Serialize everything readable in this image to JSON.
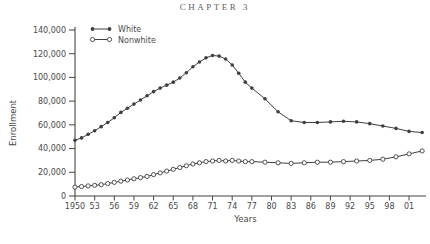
{
  "page": {
    "header": "CHAPTER 3"
  },
  "chart_data": {
    "type": "line",
    "title": "",
    "xlabel": "Years",
    "ylabel": "Enrollment",
    "ylim": [
      0,
      140000
    ],
    "xlim": [
      1950,
      2003
    ],
    "grid": false,
    "legend_position": "top-left",
    "y_ticks": {
      "values": [
        0,
        20000,
        40000,
        60000,
        80000,
        100000,
        120000,
        140000
      ],
      "labels": [
        "0",
        "20,000",
        "40,000",
        "60,000",
        "80,000",
        "100,000",
        "120,000",
        "140,000"
      ]
    },
    "x_ticks": {
      "years": [
        1950,
        1953,
        1956,
        1959,
        1962,
        1965,
        1968,
        1971,
        1974,
        1977,
        1980,
        1983,
        1986,
        1989,
        1992,
        1995,
        1998,
        2001
      ],
      "labels": [
        "1950",
        "53",
        "56",
        "59",
        "62",
        "65",
        "68",
        "71",
        "74",
        "77",
        "80",
        "83",
        "86",
        "89",
        "92",
        "95",
        "98",
        "01"
      ]
    },
    "x": [
      1950,
      1951,
      1952,
      1953,
      1954,
      1955,
      1956,
      1957,
      1958,
      1959,
      1960,
      1961,
      1962,
      1963,
      1964,
      1965,
      1966,
      1967,
      1968,
      1969,
      1970,
      1971,
      1972,
      1973,
      1974,
      1975,
      1976,
      1977,
      1979,
      1981,
      1983,
      1985,
      1987,
      1989,
      1991,
      1993,
      1995,
      1997,
      1999,
      2001,
      2003
    ],
    "series": [
      {
        "name": "White",
        "marker": "filled-circle",
        "color": "#3f3f3f",
        "values": [
          47000,
          49000,
          52000,
          55000,
          58500,
          62000,
          66000,
          70500,
          74000,
          77500,
          81000,
          84500,
          88000,
          91000,
          93500,
          96000,
          99500,
          104000,
          109000,
          113000,
          116500,
          118500,
          118000,
          115500,
          110500,
          103500,
          96000,
          91000,
          82000,
          71000,
          63500,
          62000,
          62000,
          62500,
          63000,
          62500,
          61000,
          59000,
          57000,
          54500,
          53500
        ]
      },
      {
        "name": "Nonwhite",
        "marker": "open-circle",
        "color": "#3f3f3f",
        "values": [
          7500,
          8000,
          8500,
          9000,
          9500,
          10500,
          11500,
          12500,
          13500,
          14500,
          15500,
          16500,
          18000,
          19500,
          21000,
          22500,
          24000,
          25500,
          27000,
          28000,
          29000,
          29500,
          30000,
          29500,
          30000,
          29500,
          29000,
          29000,
          28500,
          28000,
          27500,
          28000,
          28500,
          28500,
          29000,
          29500,
          30000,
          31000,
          33000,
          35500,
          38000
        ]
      }
    ],
    "colors": {
      "axis": "#454545",
      "text": "#4a4a4a",
      "header": "#5f5f5f",
      "background": "#ffffff"
    }
  }
}
